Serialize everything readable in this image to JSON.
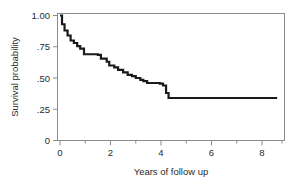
{
  "chart_data": {
    "type": "line",
    "subtype": "kaplan-meier-step",
    "title": "",
    "xlabel": "Years of follow up",
    "ylabel": "Survival probability",
    "xlim": [
      0,
      9.1
    ],
    "ylim": [
      0,
      1.0
    ],
    "grid": false,
    "legend": null,
    "xtick_labels": [
      "0",
      "2",
      "4",
      "6",
      "8"
    ],
    "xtick_values": [
      0,
      2,
      4,
      6,
      8
    ],
    "xtick_minor_values": [
      1,
      3,
      5,
      7,
      9
    ],
    "ytick_labels": [
      "1.00",
      ".75",
      ".50",
      ".25",
      "0"
    ],
    "ytick_values": [
      1.0,
      0.75,
      0.5,
      0.25,
      0
    ],
    "series": [
      {
        "name": "Survival",
        "color": "#1a1a1a",
        "line_width": 2.2,
        "x": [
          0.0,
          0.08,
          0.08,
          0.18,
          0.18,
          0.3,
          0.3,
          0.42,
          0.42,
          0.55,
          0.55,
          0.68,
          0.68,
          0.8,
          0.8,
          0.95,
          0.95,
          1.5,
          1.5,
          1.62,
          1.62,
          1.85,
          1.85,
          1.95,
          1.95,
          2.15,
          2.15,
          2.3,
          2.3,
          2.5,
          2.5,
          2.68,
          2.68,
          2.85,
          2.85,
          3.0,
          3.0,
          3.18,
          3.18,
          3.3,
          3.3,
          3.45,
          3.45,
          3.95,
          3.95,
          4.08,
          4.08,
          4.2,
          4.2,
          4.3,
          4.3,
          8.6
        ],
        "y": [
          1.0,
          1.0,
          0.93,
          0.93,
          0.88,
          0.88,
          0.84,
          0.84,
          0.8,
          0.8,
          0.78,
          0.78,
          0.755,
          0.755,
          0.735,
          0.735,
          0.69,
          0.69,
          0.685,
          0.685,
          0.655,
          0.655,
          0.63,
          0.63,
          0.6,
          0.6,
          0.585,
          0.585,
          0.565,
          0.565,
          0.545,
          0.545,
          0.525,
          0.525,
          0.515,
          0.515,
          0.5,
          0.5,
          0.485,
          0.485,
          0.475,
          0.475,
          0.46,
          0.46,
          0.455,
          0.455,
          0.44,
          0.44,
          0.38,
          0.38,
          0.34,
          0.34
        ]
      }
    ]
  },
  "axes": {
    "frame_color": "#8c8c8c",
    "tick_color": "#8c8c8c"
  }
}
